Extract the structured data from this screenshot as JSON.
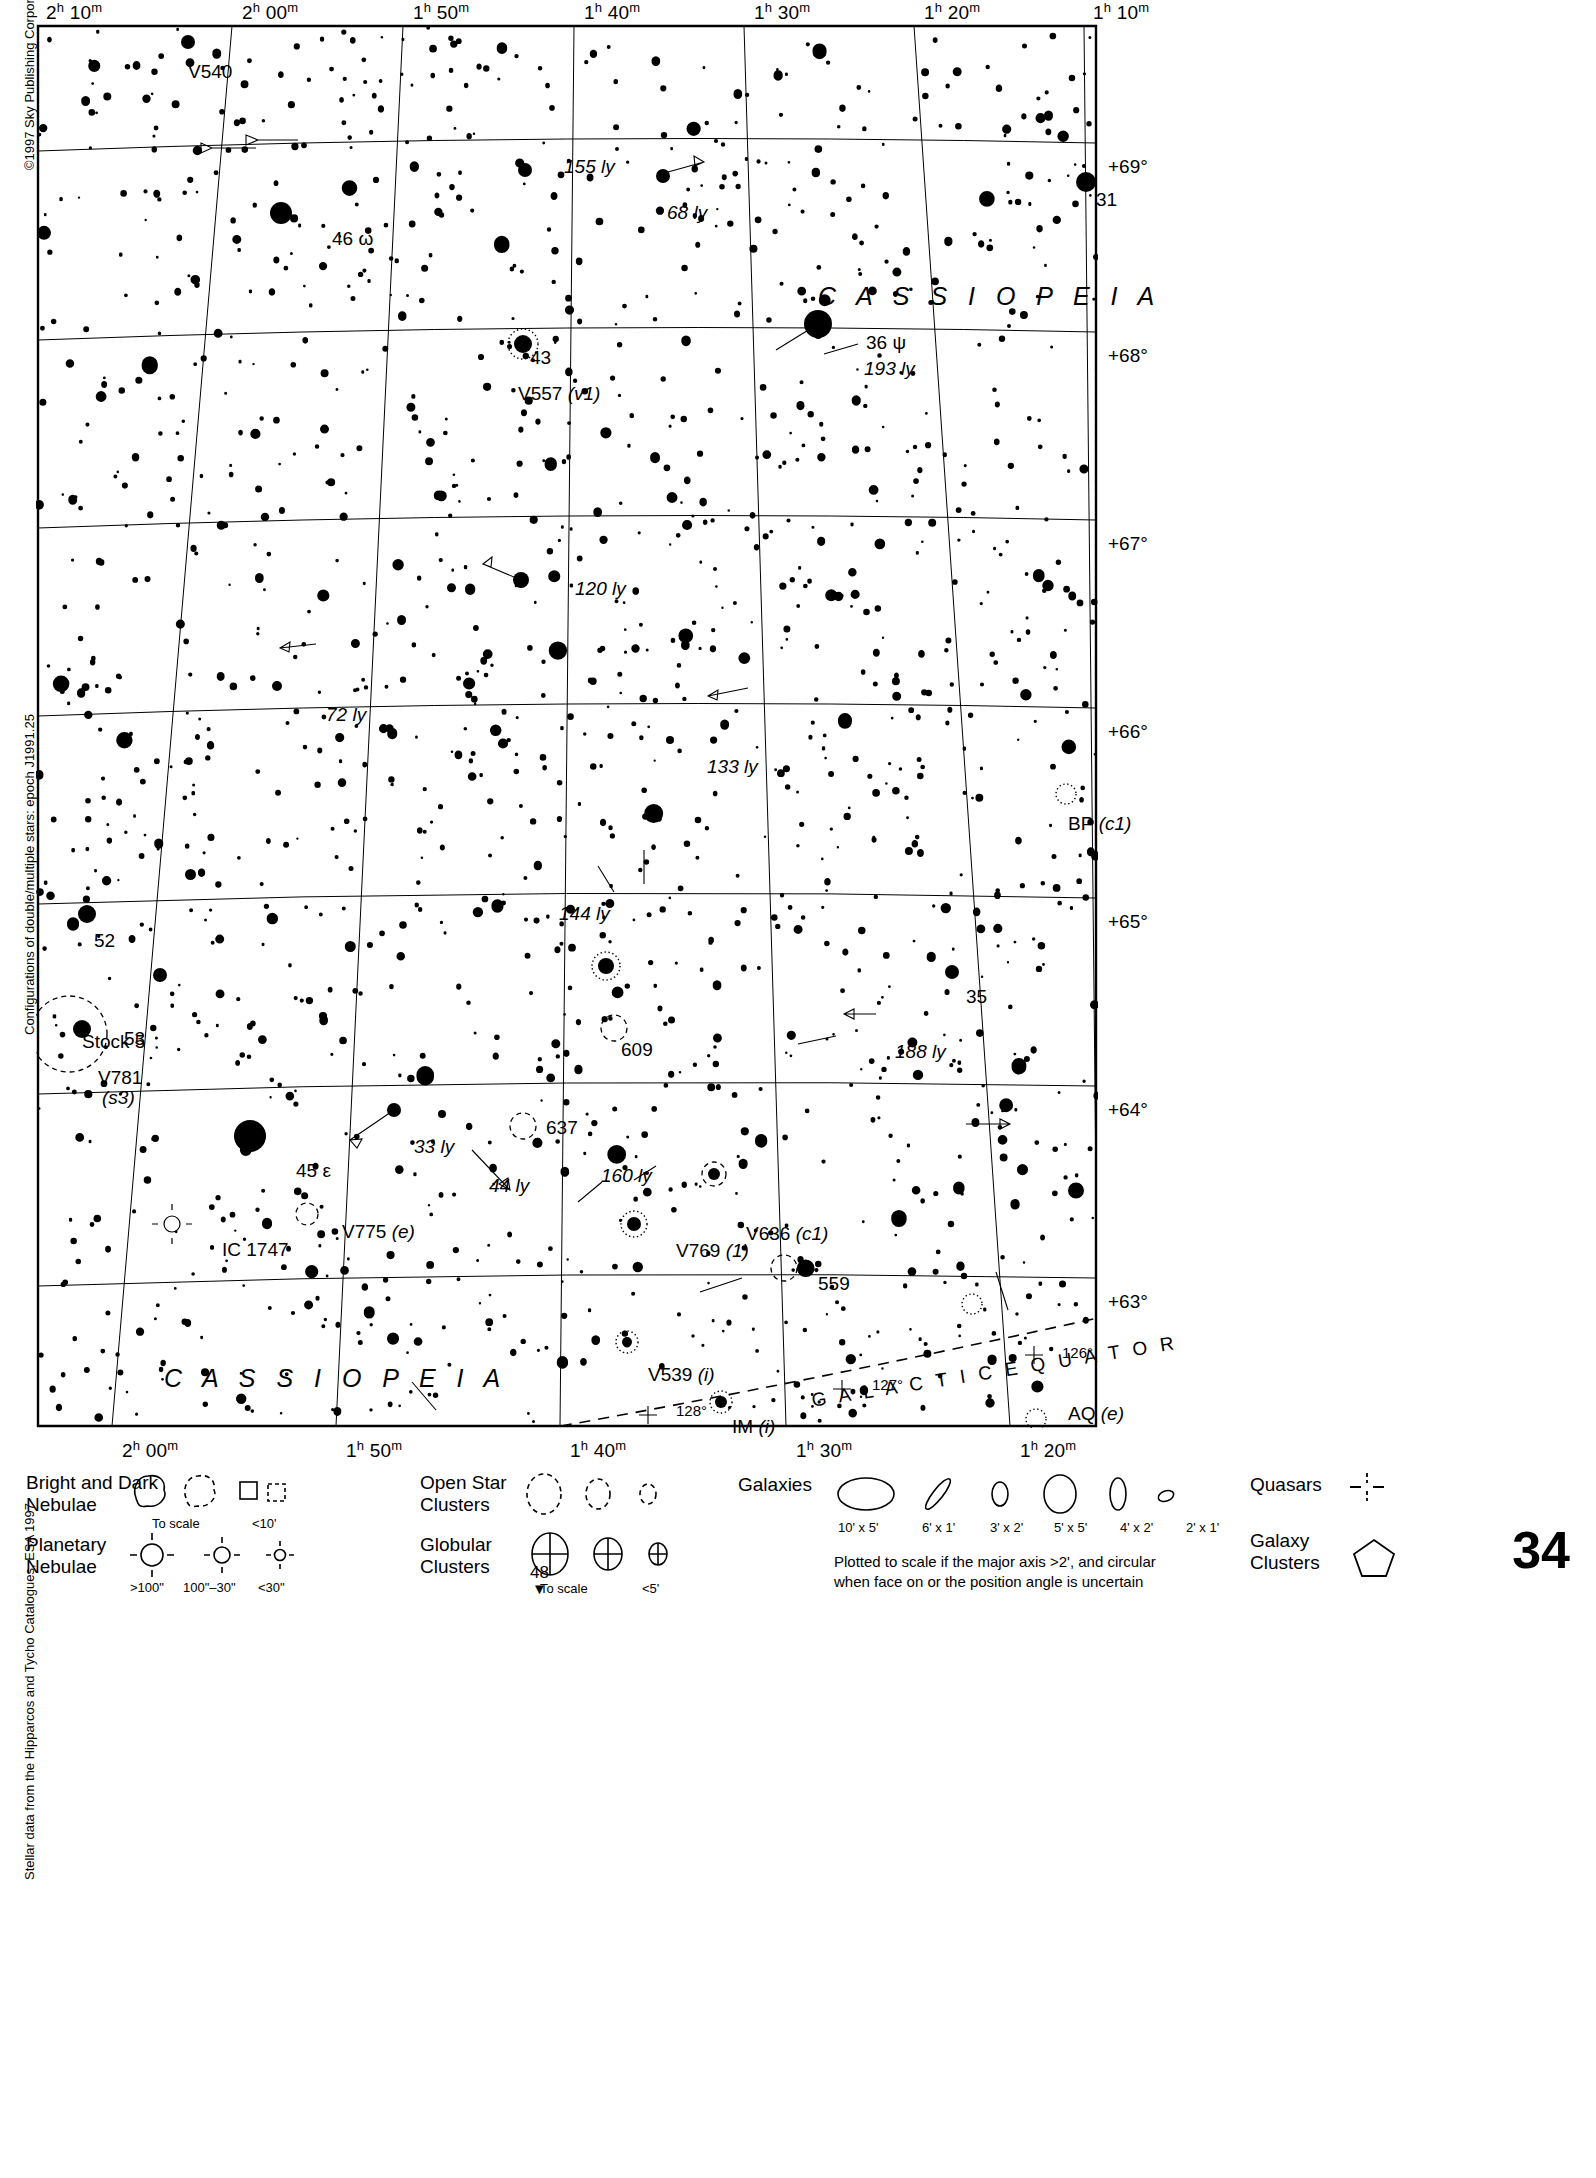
{
  "page": {
    "number": "34",
    "next_page": "48",
    "next_page_arrow": "▼",
    "copyright": "©1997 Sky Publishing Corporation",
    "credit_doubles": "Configurations of double/multiple stars: epoch J1991.25",
    "credit_data": "Stellar data from the Hipparcos and Tycho Catalogues, ESA 1997"
  },
  "axes": {
    "ra_top": [
      {
        "h": "2",
        "m": "10",
        "x": 36
      },
      {
        "h": "2",
        "m": "00",
        "x": 232
      },
      {
        "h": "1",
        "m": "50",
        "x": 403
      },
      {
        "h": "1",
        "m": "40",
        "x": 574
      },
      {
        "h": "1",
        "m": "30",
        "x": 744
      },
      {
        "h": "1",
        "m": "20",
        "x": 914
      },
      {
        "h": "1",
        "m": "10",
        "x": 1083
      }
    ],
    "ra_bottom": [
      {
        "h": "2",
        "m": "00",
        "x": 112
      },
      {
        "h": "1",
        "m": "50",
        "x": 336
      },
      {
        "h": "1",
        "m": "40",
        "x": 560
      },
      {
        "h": "1",
        "m": "30",
        "x": 786
      },
      {
        "h": "1",
        "m": "20",
        "x": 1010
      }
    ],
    "dec_right": [
      {
        "label": "+69°",
        "y": 143
      },
      {
        "label": "+68°",
        "y": 332
      },
      {
        "label": "+67°",
        "y": 520
      },
      {
        "label": "+66°",
        "y": 708
      },
      {
        "label": "+65°",
        "y": 898
      },
      {
        "label": "+64°",
        "y": 1086
      },
      {
        "label": "+63°",
        "y": 1278
      }
    ]
  },
  "constellation_labels": [
    {
      "text": "C A S S I O P E I A",
      "x": 782,
      "y": 258
    },
    {
      "text": "C A S S I O P E I A",
      "x": 128,
      "y": 1340
    }
  ],
  "galactic": {
    "equator_label": "G A L A C T I C   E Q U A T O R",
    "ticks": [
      {
        "label": "128°",
        "x": 640,
        "y": 1378
      },
      {
        "label": "127°",
        "x": 836,
        "y": 1352
      },
      {
        "label": "126°",
        "x": 1026,
        "y": 1320
      }
    ]
  },
  "object_labels": [
    {
      "name": "V540",
      "text": "V540",
      "x": 152,
      "y": 38,
      "style": "plain"
    },
    {
      "name": "155ly",
      "text": "155 ly",
      "x": 528,
      "y": 133,
      "style": "italic"
    },
    {
      "name": "68ly",
      "text": "68 ly",
      "x": 631,
      "y": 179,
      "style": "italic"
    },
    {
      "name": "31",
      "text": "31",
      "x": 1060,
      "y": 166,
      "style": "plain"
    },
    {
      "name": "46omega",
      "text": "46 ω",
      "x": 296,
      "y": 205,
      "style": "plain"
    },
    {
      "name": "36psi",
      "text": "36 ψ",
      "x": 830,
      "y": 309,
      "style": "plain"
    },
    {
      "name": "193ly",
      "text": "193 ly",
      "x": 828,
      "y": 335,
      "style": "italic"
    },
    {
      "name": "43",
      "text": "43",
      "x": 494,
      "y": 324,
      "style": "plain"
    },
    {
      "name": "V557",
      "text": "V557 (v1)",
      "x": 482,
      "y": 360,
      "style": "mixed"
    },
    {
      "name": "120ly",
      "text": "120 ly",
      "x": 539,
      "y": 555,
      "style": "italic"
    },
    {
      "name": "72ly",
      "text": "72 ly",
      "x": 290,
      "y": 681,
      "style": "italic"
    },
    {
      "name": "133ly",
      "text": "133 ly",
      "x": 671,
      "y": 733,
      "style": "italic"
    },
    {
      "name": "BP",
      "text": "BP (c1)",
      "x": 1032,
      "y": 790,
      "style": "mixed"
    },
    {
      "name": "144ly",
      "text": "144 ly",
      "x": 523,
      "y": 880,
      "style": "italic"
    },
    {
      "name": "52",
      "text": "52",
      "x": 58,
      "y": 907,
      "style": "plain"
    },
    {
      "name": "35",
      "text": "35",
      "x": 930,
      "y": 963,
      "style": "plain"
    },
    {
      "name": "Stock5",
      "text": "Stock 5",
      "x": 46,
      "y": 1008,
      "style": "plain"
    },
    {
      "name": "53",
      "text": "53",
      "x": 88,
      "y": 1005,
      "style": "plain"
    },
    {
      "name": "609",
      "text": "609",
      "x": 585,
      "y": 1016,
      "style": "plain"
    },
    {
      "name": "188ly",
      "text": "188 ly",
      "x": 859,
      "y": 1018,
      "style": "italic"
    },
    {
      "name": "V781",
      "text": "V781",
      "x": 62,
      "y": 1044,
      "style": "plain"
    },
    {
      "name": "s3",
      "text": "(s3)",
      "x": 66,
      "y": 1064,
      "style": "italic"
    },
    {
      "name": "637",
      "text": "637",
      "x": 510,
      "y": 1094,
      "style": "plain"
    },
    {
      "name": "33ly",
      "text": "33 ly",
      "x": 378,
      "y": 1113,
      "style": "italic"
    },
    {
      "name": "160ly",
      "text": "160 ly",
      "x": 565,
      "y": 1142,
      "style": "italic"
    },
    {
      "name": "45epsilon",
      "text": "45 ε",
      "x": 260,
      "y": 1137,
      "style": "plain"
    },
    {
      "name": "44ly",
      "text": "44 ly",
      "x": 453,
      "y": 1152,
      "style": "italic"
    },
    {
      "name": "V636",
      "text": "V636 (c1)",
      "x": 710,
      "y": 1200,
      "style": "mixed"
    },
    {
      "name": "V775",
      "text": "V775 (e)",
      "x": 306,
      "y": 1198,
      "style": "mixed"
    },
    {
      "name": "IC1747",
      "text": "IC 1747",
      "x": 186,
      "y": 1216,
      "style": "plain"
    },
    {
      "name": "V769",
      "text": "V769 (1)",
      "x": 640,
      "y": 1217,
      "style": "mixed"
    },
    {
      "name": "559",
      "text": "559",
      "x": 782,
      "y": 1250,
      "style": "plain"
    },
    {
      "name": "V539",
      "text": "V539 (i)",
      "x": 612,
      "y": 1341,
      "style": "mixed"
    },
    {
      "name": "AQ",
      "text": "AQ (e)",
      "x": 1032,
      "y": 1380,
      "style": "mixed"
    },
    {
      "name": "IM",
      "text": "IM (i)",
      "x": 696,
      "y": 1393,
      "style": "mixed"
    }
  ],
  "legend": {
    "nebulae": {
      "title_line1": "Bright and Dark",
      "title_line2": "Nebulae",
      "sub_to_scale": "To scale",
      "sub_small": "<10'"
    },
    "planetary": {
      "title_line1": "Planetary",
      "title_line2": "Nebulae",
      "sizes": [
        ">100\"",
        "100\"–30\"",
        "<30\""
      ]
    },
    "open_clusters": {
      "title_line1": "Open Star",
      "title_line2": "Clusters"
    },
    "globular_clusters": {
      "title_line1": "Globular",
      "title_line2": "Clusters",
      "sub_to_scale": "To scale",
      "sub_small": "<5'"
    },
    "galaxies": {
      "title": "Galaxies",
      "sizes": [
        "10' x 5'",
        "6' x 1'",
        "3' x 2'",
        "5' x 5'",
        "4' x 2'",
        "2' x 1'"
      ],
      "note_line1": "Plotted to scale if the major axis >2', and circular",
      "note_line2": "when face on or the position angle is uncertain"
    },
    "quasars": {
      "title": "Quasars"
    },
    "galaxy_clusters": {
      "title_line1": "Galaxy",
      "title_line2": "Clusters"
    }
  },
  "chart_data": {
    "type": "scatter",
    "xlabel": "Right Ascension",
    "ylabel": "Declination",
    "xlim": [
      "2h 10m",
      "1h 10m"
    ],
    "ylim": [
      "+62.6°",
      "+69.4°"
    ],
    "grid": true,
    "legend_position": "bottom"
  }
}
